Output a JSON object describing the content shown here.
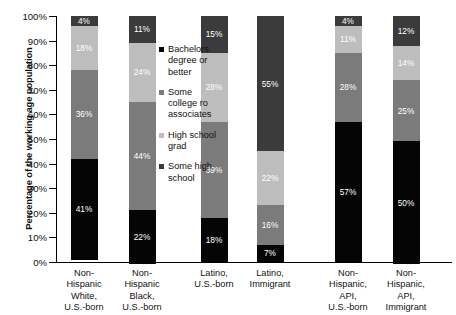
{
  "chart_data": {
    "type": "bar",
    "stacked": true,
    "title": "",
    "xlabel": "",
    "ylabel": "Percentage of the working age population",
    "ylim": [
      0,
      100
    ],
    "grid": false,
    "legend_position": "inside-center-left",
    "ytick_labels": [
      "100%",
      "90%",
      "80%",
      "70%",
      "60%",
      "50%",
      "40%",
      "30%",
      "20%",
      "10%",
      "0%"
    ],
    "ytick_values": [
      100,
      90,
      80,
      70,
      60,
      50,
      40,
      30,
      20,
      10,
      0
    ],
    "categories": [
      "Non-\nHispanic\nWhite,\nU.S.-born",
      "Non-\nHispanic\nBlack,\nU.S.-born",
      "Latino,\nU.S.-born",
      "Latino,\nImmigrant",
      "Non-\nHispanic,\nAPI,\nU.S.-born",
      "Non-\nHispanic,\nAPI,\nImmigrant"
    ],
    "series": [
      {
        "name": "Bachelors degree or better",
        "color": "#050505",
        "values": [
          41,
          22,
          18,
          7,
          57,
          50
        ],
        "labels": [
          "41%",
          "22%",
          "18%",
          "7%",
          "57%",
          "50%"
        ]
      },
      {
        "name": "Some college ro associates",
        "color": "#7b7b7b",
        "values": [
          36,
          44,
          39,
          16,
          28,
          25
        ],
        "labels": [
          "36%",
          "44%",
          "39%",
          "16%",
          "28%",
          "25%"
        ]
      },
      {
        "name": "High school grad",
        "color": "#bdbdbd",
        "values": [
          18,
          24,
          28,
          22,
          11,
          14
        ],
        "labels": [
          "18%",
          "24%",
          "28%",
          "22%",
          "11%",
          "14%"
        ]
      },
      {
        "name": "Some high school",
        "color": "#3b3b3b",
        "values": [
          4,
          11,
          15,
          55,
          4,
          12
        ],
        "labels": [
          "4%",
          "11%",
          "15%",
          "55%",
          "4%",
          "12%"
        ]
      }
    ],
    "legend_entries": [
      {
        "label": "Bachelors\ndegree or\nbetter",
        "color": "#050505"
      },
      {
        "label": "Some\ncollege ro\nassociates",
        "color": "#7b7b7b"
      },
      {
        "label": "High school\ngrad",
        "color": "#bdbdbd"
      },
      {
        "label": "Some high\nschool",
        "color": "#3b3b3b"
      }
    ]
  }
}
